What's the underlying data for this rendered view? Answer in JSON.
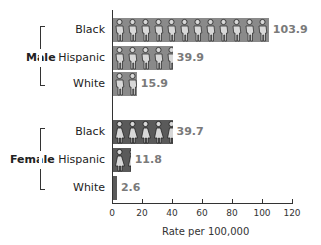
{
  "chart_data": {
    "type": "bar",
    "orientation": "horizontal",
    "title": "",
    "xlabel": "Rate per 100,000",
    "ylabel": "",
    "xlim": [
      0,
      120
    ],
    "x_ticks": [
      "0",
      "20",
      "40",
      "60",
      "80",
      "100",
      "120"
    ],
    "grid": false,
    "groups": [
      {
        "name": "Male",
        "categories": [
          "Black",
          "Hispanic",
          "White"
        ],
        "values": [
          103.9,
          39.9,
          15.9
        ],
        "value_labels": [
          "103.9",
          "39.9",
          "15.9"
        ],
        "bar_color": "#8a8a8a",
        "icon": "male-figure-icon"
      },
      {
        "name": "Female",
        "categories": [
          "Black",
          "Hispanic",
          "White"
        ],
        "values": [
          39.7,
          11.8,
          2.6
        ],
        "value_labels": [
          "39.7",
          "11.8",
          "2.6"
        ],
        "bar_color": "#5a5a5a",
        "icon": "female-figure-icon"
      }
    ]
  }
}
